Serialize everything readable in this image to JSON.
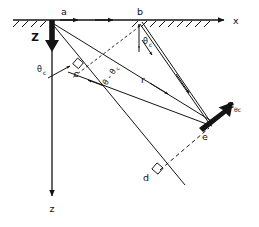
{
  "figure": {
    "background_color": "#ffffff",
    "ink_color": "#141414"
  },
  "axes": {
    "horizontal": {
      "label": "x",
      "name": "x-axis",
      "direction": "right",
      "hatched_surface": true
    },
    "vertical": {
      "label": "z",
      "name": "z-axis",
      "direction": "down"
    }
  },
  "vectors": [
    {
      "id": "Z",
      "label": "Z",
      "style": "bold",
      "description": "bold downward source vector at point a"
    },
    {
      "id": "e_theta_c",
      "label": "e",
      "subscript": "θc",
      "style": "bold",
      "description": "bold unit vector at point e pointing up-right"
    }
  ],
  "points": [
    {
      "id": "a",
      "label": "a"
    },
    {
      "id": "b",
      "label": "b"
    },
    {
      "id": "c",
      "label": "c"
    },
    {
      "id": "d",
      "label": "d"
    },
    {
      "id": "e",
      "label": "e"
    }
  ],
  "angle_labels": [
    {
      "id": "theta-c-left",
      "base": "θ",
      "subscript": "c"
    },
    {
      "id": "theta-c-b",
      "base": "θ",
      "subscript": "c"
    },
    {
      "id": "theta-minus-theta-c",
      "text": "θ - θ",
      "subscript": "c"
    }
  ],
  "length_labels": [
    {
      "id": "r",
      "label": "r"
    }
  ],
  "right_angles": [
    {
      "id": "right-angle-c",
      "at": "c"
    },
    {
      "id": "right-angle-d",
      "at": "d"
    }
  ]
}
